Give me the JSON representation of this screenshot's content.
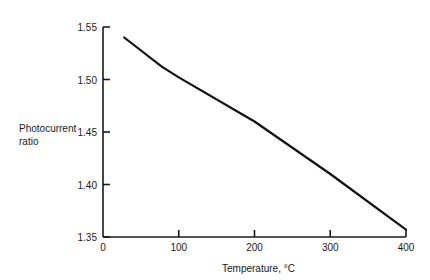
{
  "chart_data": {
    "type": "line",
    "title": "",
    "xlabel": "Temperature, °C",
    "ylabel": "Photocurrent ratio",
    "ylabel_lines": [
      "Photocurrent",
      "ratio"
    ],
    "xlim": [
      0,
      400
    ],
    "ylim": [
      1.35,
      1.55
    ],
    "xticks": [
      0,
      100,
      200,
      300,
      400
    ],
    "xtick_labels": [
      "0",
      "100",
      "200",
      "300",
      "400"
    ],
    "yticks": [
      1.35,
      1.4,
      1.45,
      1.5,
      1.55
    ],
    "ytick_labels": [
      "1.35",
      "1.40",
      "1.45",
      "1.50",
      "1.55"
    ],
    "grid": false,
    "legend": null,
    "series": [
      {
        "name": "Photocurrent ratio",
        "color": "#111111",
        "x": [
          28,
          78,
          100,
          200,
          300,
          400
        ],
        "y": [
          1.54,
          1.512,
          1.502,
          1.46,
          1.41,
          1.357
        ]
      }
    ]
  }
}
